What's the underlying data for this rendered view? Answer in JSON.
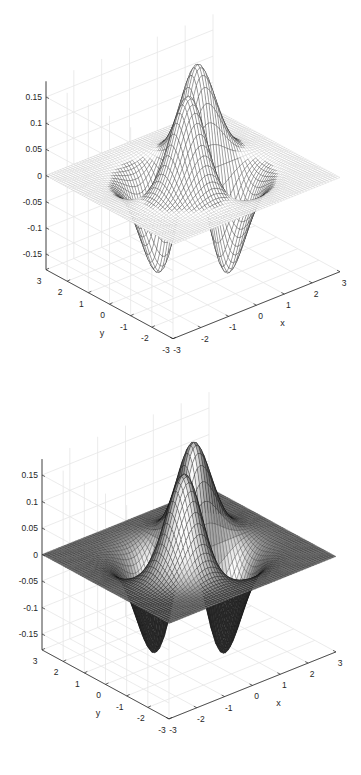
{
  "chart_data": [
    {
      "type": "surface-mesh",
      "style": "mesh",
      "function": "z = x * y * exp(-(x^2 + y^2))",
      "xlabel": "x",
      "ylabel": "y",
      "zlabel": "",
      "xlim": [
        -3,
        3
      ],
      "ylim": [
        -3,
        3
      ],
      "zlim": [
        -0.18,
        0.18
      ],
      "xticks": [
        -3,
        -2,
        -1,
        0,
        1,
        2,
        3
      ],
      "yticks": [
        -3,
        -2,
        -1,
        0,
        1,
        2,
        3
      ],
      "zticks": [
        -0.15,
        -0.1,
        -0.05,
        0,
        0.05,
        0.1,
        0.15
      ],
      "xtick_labels": [
        "-3",
        "-2",
        "-1",
        "0",
        "1",
        "2",
        "3"
      ],
      "ytick_labels": [
        "-3",
        "-2",
        "-1",
        "0",
        "1",
        "2",
        "3"
      ],
      "ztick_labels": [
        "-0.15",
        "-0.1",
        "-0.05",
        "0",
        "0.05",
        "0.1",
        "0.15"
      ],
      "grid": true,
      "grid_points": 61,
      "edge_color": "#000000",
      "face_color": "#ffffff"
    },
    {
      "type": "surface",
      "style": "shaded-surface",
      "function": "z = x * y * exp(-(x^2 + y^2))",
      "xlabel": "x",
      "ylabel": "y",
      "zlabel": "",
      "xlim": [
        -3,
        3
      ],
      "ylim": [
        -3,
        3
      ],
      "zlim": [
        -0.18,
        0.18
      ],
      "xticks": [
        -3,
        -2,
        -1,
        0,
        1,
        2,
        3
      ],
      "yticks": [
        -3,
        -2,
        -1,
        0,
        1,
        2,
        3
      ],
      "zticks": [
        -0.15,
        -0.1,
        -0.05,
        0,
        0.05,
        0.1,
        0.15
      ],
      "xtick_labels": [
        "-3",
        "-2",
        "-1",
        "0",
        "1",
        "2",
        "3"
      ],
      "ytick_labels": [
        "-3",
        "-2",
        "-1",
        "0",
        "1",
        "2",
        "3"
      ],
      "ztick_labels": [
        "-0.15",
        "-0.1",
        "-0.05",
        "0",
        "0.05",
        "0.1",
        "0.15"
      ],
      "grid": true,
      "grid_points": 61,
      "edge_color": "#000000",
      "colormap": "gray"
    }
  ]
}
